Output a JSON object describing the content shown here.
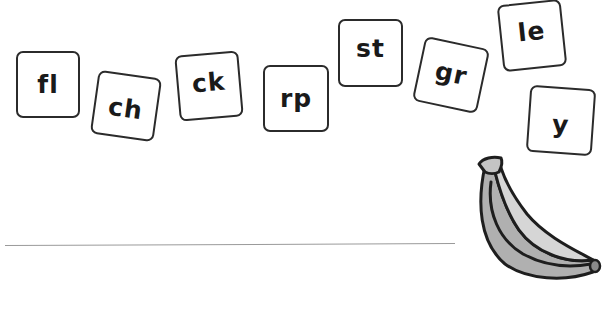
{
  "worksheet": {
    "tiles": [
      {
        "label": "fl"
      },
      {
        "label": "ch"
      },
      {
        "label": "ck"
      },
      {
        "label": "rp"
      },
      {
        "label": "st"
      },
      {
        "label": "gr"
      },
      {
        "label": "le"
      },
      {
        "label": "y"
      }
    ],
    "picture": {
      "icon": "banana-icon"
    },
    "answer_line": {
      "value": ""
    }
  },
  "colors": {
    "tile_border": "#2b2b2b",
    "text": "#1a1a1a",
    "line": "#9a9a9a",
    "banana_fill_light": "#d4d4d4",
    "banana_fill_dark": "#b0b0b0",
    "banana_outline": "#1e1e1e"
  }
}
